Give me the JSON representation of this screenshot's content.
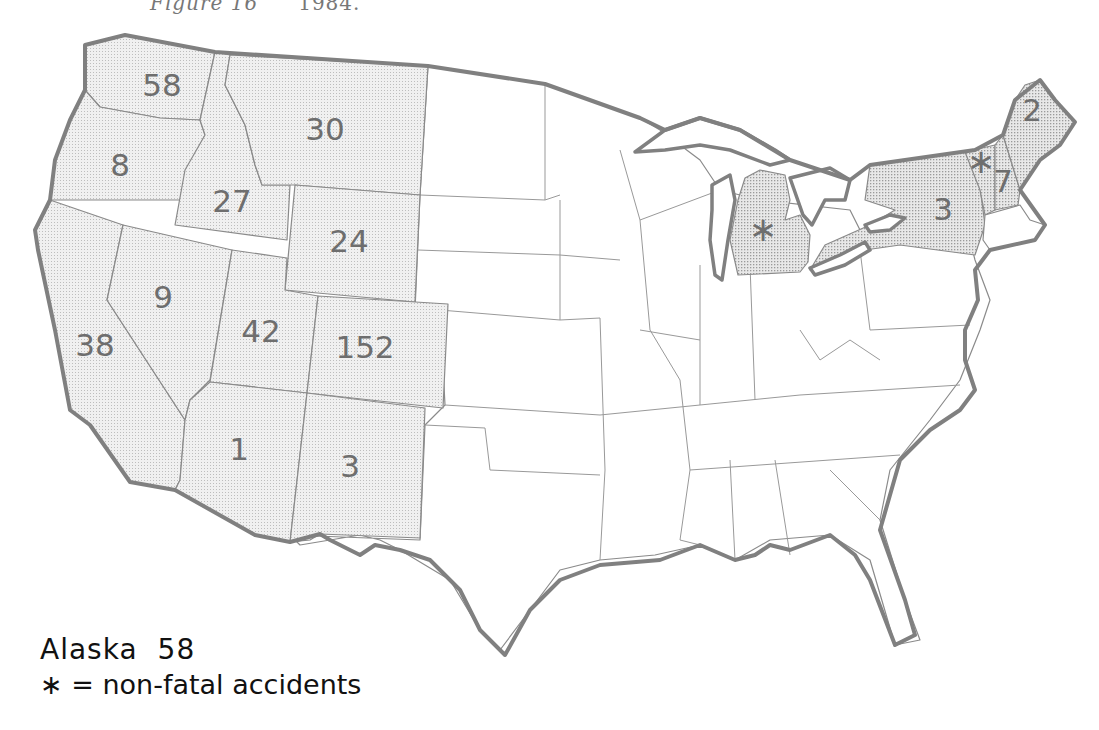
{
  "caption": {
    "figure": "Figure 16",
    "year": "1984."
  },
  "legend": {
    "alaska_label": "Alaska",
    "alaska_value": "58",
    "symbol": "∗",
    "symbol_meaning": "= non-fatal accidents"
  },
  "states": {
    "WA": {
      "value": "58",
      "fill": "shaded"
    },
    "OR": {
      "value": "8",
      "fill": "shaded"
    },
    "CA": {
      "value": "38",
      "fill": "shaded"
    },
    "ID": {
      "value": "27",
      "fill": "shaded"
    },
    "NV": {
      "value": "9",
      "fill": "shaded"
    },
    "MT": {
      "value": "30",
      "fill": "shaded"
    },
    "WY": {
      "value": "24",
      "fill": "shaded"
    },
    "UT": {
      "value": "42",
      "fill": "shaded"
    },
    "CO": {
      "value": "152",
      "fill": "shaded"
    },
    "AZ": {
      "value": "1",
      "fill": "shaded"
    },
    "NM": {
      "value": "3",
      "fill": "shaded"
    },
    "MI": {
      "value": "∗",
      "fill": "shaded-dark"
    },
    "NY": {
      "value": "3",
      "fill": "shaded-dark"
    },
    "VT": {
      "value": "∗",
      "fill": "shaded-dark"
    },
    "NH": {
      "value": "7",
      "fill": "shaded-dark"
    },
    "ME": {
      "value": "2",
      "fill": "shaded-dark"
    }
  },
  "colors": {
    "outline": "#808080",
    "shade": "#e4e4e4",
    "label": "#6e6e6e"
  }
}
